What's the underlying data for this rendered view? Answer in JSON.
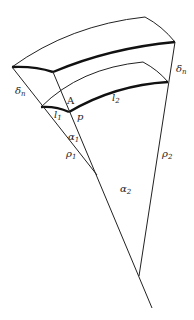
{
  "diagram": {
    "labels": {
      "delta_left": {
        "base": "δ",
        "sub": "n"
      },
      "delta_right": {
        "base": "δ",
        "sub": "n"
      },
      "A": {
        "base": "A",
        "sub": ""
      },
      "p": {
        "base": "p",
        "sub": ""
      },
      "l1": {
        "base": "l",
        "sub": "1"
      },
      "l2": {
        "base": "l",
        "sub": "2"
      },
      "alpha1": {
        "base": "α",
        "sub": "1"
      },
      "alpha2": {
        "base": "α",
        "sub": "2"
      },
      "rho1": {
        "base": "ρ",
        "sub": "1"
      },
      "rho2": {
        "base": "ρ",
        "sub": "2"
      }
    },
    "colors": {
      "line": "#222222",
      "background": "#ffffff"
    }
  }
}
